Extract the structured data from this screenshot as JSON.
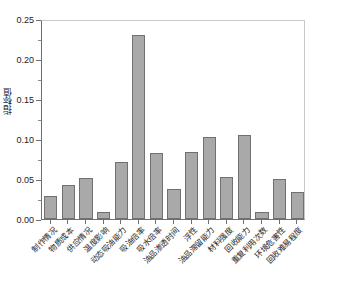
{
  "chart_data": {
    "type": "bar",
    "title": "",
    "subtitle": "",
    "xlabel": "",
    "ylabel": "指标值",
    "ylim": [
      0.0,
      0.25
    ],
    "xlim_categories": 15,
    "grid": false,
    "legend": null,
    "legend_position": "none",
    "bar_color": "#a9a9a9",
    "bar_edge_color": "#707070",
    "axis_color": "#6f6f6f",
    "background_color": "#ffffff",
    "ytick_labels": [
      "0.00",
      "0.05",
      "0.10",
      "0.15",
      "0.20",
      "0.25"
    ],
    "ytick_values": [
      0.0,
      0.05,
      0.1,
      0.15,
      0.2,
      0.25
    ],
    "categories": [
      "制作情况",
      "物质成本",
      "供应情况",
      "温度影响",
      "动态吸油能力",
      "吸油倍率",
      "吸水倍率",
      "油品渗透时间",
      "浮性",
      "油品滞留能力",
      "材料强度",
      "回收能力",
      "重复利用次数",
      "环境危害性",
      "回收难易程度"
    ],
    "values": [
      0.029,
      0.042,
      0.051,
      0.009,
      0.071,
      0.23,
      0.083,
      0.037,
      0.084,
      0.103,
      0.053,
      0.105,
      0.009,
      0.05,
      0.034
    ]
  }
}
